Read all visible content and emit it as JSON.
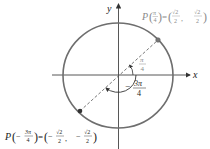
{
  "diagram": {
    "type": "unit-circle",
    "axes": {
      "x_label": "x",
      "y_label": "y"
    },
    "colors": {
      "circle": "#6e6e6e",
      "axis": "#444444",
      "point": "#333333",
      "gray_text": "#8a8a8a"
    },
    "angles": [
      {
        "name": "pi-over-4",
        "label_num": "π",
        "label_den": "4",
        "sign": ""
      },
      {
        "name": "minus-3pi-over-4",
        "label_num": "3π",
        "label_den": "4",
        "sign": "−"
      }
    ],
    "points": [
      {
        "name": "P(π/4)",
        "P": "P",
        "arg_num": "π",
        "arg_den": "4",
        "arg_sign": "",
        "eq": "=",
        "x_num": "√2",
        "x_den": "2",
        "x_sign": "",
        "y_num": "√2",
        "y_den": "2",
        "y_sign": ""
      },
      {
        "name": "P(-3π/4)",
        "P": "P",
        "arg_num": "3π",
        "arg_den": "4",
        "arg_sign": "−",
        "eq": "=",
        "x_num": "√2",
        "x_den": "2",
        "x_sign": "−",
        "y_num": "√2",
        "y_den": "2",
        "y_sign": "−"
      }
    ],
    "punct": {
      "lparen": "(",
      "rparen": ")",
      "comma": ","
    }
  }
}
